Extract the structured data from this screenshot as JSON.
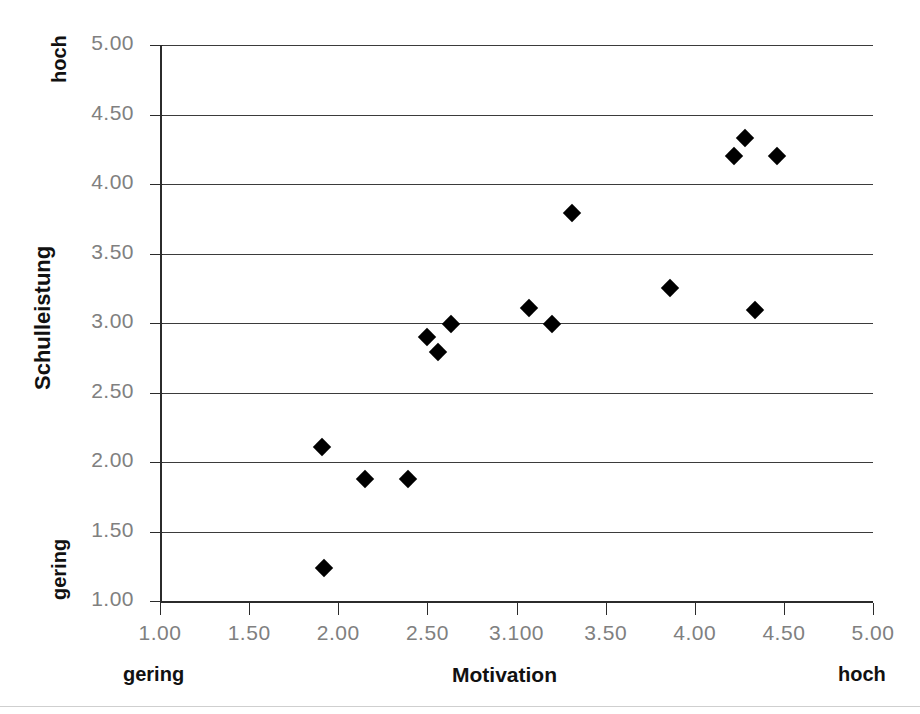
{
  "chart_data": {
    "type": "scatter",
    "title": "",
    "xlabel": "Motivation",
    "ylabel": "Schulleistung",
    "xlim": [
      1.0,
      5.0
    ],
    "ylim": [
      1.0,
      5.0
    ],
    "grid": "horizontal",
    "legend": "none",
    "marker": "filled-diamond",
    "marker_color": "#000000",
    "xticks": [
      "1.00",
      "1.50",
      "2.00",
      "2.50",
      "3.100",
      "3.50",
      "4.00",
      "4.50",
      "5.00"
    ],
    "xtick_values": [
      1.0,
      1.5,
      2.0,
      2.5,
      3.0,
      3.5,
      4.0,
      4.5,
      5.0
    ],
    "yticks": [
      "1.00",
      "1.50",
      "2.00",
      "2.50",
      "3.00",
      "3.50",
      "4.00",
      "4.50",
      "5.00"
    ],
    "ytick_values": [
      1.0,
      1.5,
      2.0,
      2.5,
      3.0,
      3.5,
      4.0,
      4.5,
      5.0
    ],
    "annotations": {
      "y_high": "hoch",
      "y_low": "gering",
      "x_low": "gering",
      "x_high": "hoch"
    },
    "points": [
      {
        "x": 1.92,
        "y": 1.24
      },
      {
        "x": 1.91,
        "y": 2.11
      },
      {
        "x": 2.15,
        "y": 1.88
      },
      {
        "x": 2.39,
        "y": 1.88
      },
      {
        "x": 2.5,
        "y": 2.9
      },
      {
        "x": 2.56,
        "y": 2.79
      },
      {
        "x": 2.63,
        "y": 2.99
      },
      {
        "x": 3.07,
        "y": 3.11
      },
      {
        "x": 3.2,
        "y": 2.99
      },
      {
        "x": 3.31,
        "y": 3.79
      },
      {
        "x": 3.86,
        "y": 3.25
      },
      {
        "x": 4.22,
        "y": 4.2
      },
      {
        "x": 4.28,
        "y": 4.33
      },
      {
        "x": 4.34,
        "y": 3.09
      },
      {
        "x": 4.46,
        "y": 4.2
      }
    ]
  }
}
